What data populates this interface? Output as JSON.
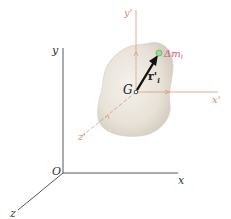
{
  "diagram": {
    "fixed_axes": {
      "origin_label": "O",
      "x_label": "x",
      "y_label": "y",
      "z_label": "z"
    },
    "body_axes": {
      "center_label": "G",
      "x_label": "x'",
      "y_label": "y'",
      "z_label": "z'"
    },
    "position_vector_label": "r'",
    "position_vector_subscript": "i",
    "mass_element_label": "Δm",
    "mass_element_subscript": "i",
    "colors": {
      "fixed_axes": "#444444",
      "body_axes": "#d99a7a",
      "body_fill": "#e9e4dc",
      "vector": "#111111",
      "mass_element": "#7ccf7c",
      "mass_label": "#d4607a"
    }
  }
}
